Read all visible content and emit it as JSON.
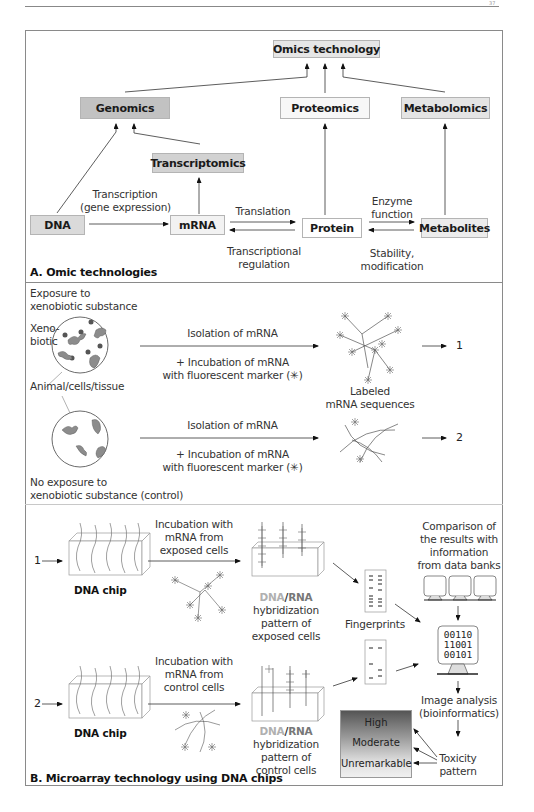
{
  "page": {
    "page_number": "37"
  },
  "panel_a": {
    "caption": "A. Omic technologies",
    "nodes": {
      "omics_technology": "Omics technology",
      "genomics": "Genomics",
      "proteomics": "Proteomics",
      "metabolomics": "Metabolomics",
      "transcriptomics": "Transcriptomics",
      "dna": "DNA",
      "mrna": "mRNA",
      "protein": "Protein",
      "metabolites": "Metabolites"
    },
    "edge_labels": {
      "transcription_1": "Transcription",
      "transcription_2": "(gene expression)",
      "translation": "Translation",
      "transcriptional_1": "Transcriptional",
      "transcriptional_2": "regulation",
      "enzyme_1": "Enzyme",
      "enzyme_2": "function",
      "stability_1": "Stability,",
      "stability_2": "modification"
    },
    "colors": {
      "omics_technology": "#e6e6e6",
      "genomics": "#c2c2c2",
      "proteomics": "#f7f7f7",
      "metabolomics": "#e4e4e4",
      "transcriptomics": "#d2d2d2",
      "dna": "#dadada",
      "mrna": "#f2f2f2",
      "protein": "#ffffff",
      "metabolites": "#ececec"
    }
  },
  "panel_exposure": {
    "exposure_1": "Exposure to",
    "exposure_2": "xenobiotic substance",
    "xenobiotic_1": "Xeno-",
    "xenobiotic_2": "biotic",
    "animal_label": "Animal/cells/tissue",
    "row1": {
      "top_label": "Isolation of mRNA",
      "bottom_1": "+ Incubation of mRNA",
      "bottom_2": "with fluorescent marker (✳)",
      "result_1": "Labeled",
      "result_2": "mRNA sequences",
      "output_number": "1"
    },
    "row2": {
      "top_label": "Isolation of mRNA",
      "bottom_1": "+ Incubation of mRNA",
      "bottom_2": "with fluorescent marker (✳)",
      "output_number": "2"
    },
    "control_1": "No exposure to",
    "control_2": "xenobiotic substance (control)"
  },
  "panel_b": {
    "caption": "B. Microarray technology using DNA chips",
    "row1": {
      "input_number": "1",
      "chip_label": "DNA chip",
      "incubation_1": "Incubation with",
      "incubation_2": "mRNA from",
      "incubation_3": "exposed cells",
      "hyb_dna": "DNA",
      "hyb_slash": "/",
      "hyb_rna": "RNA",
      "hyb_2": "hybridization",
      "hyb_3": "pattern of",
      "hyb_4": "exposed cells"
    },
    "row2": {
      "input_number": "2",
      "chip_label": "DNA chip",
      "incubation_1": "Incubation with",
      "incubation_2": "mRNA from",
      "incubation_3": "control cells",
      "hyb_dna": "DNA",
      "hyb_slash": "/",
      "hyb_rna": "RNA",
      "hyb_2": "hybridization",
      "hyb_3": "pattern of",
      "hyb_4": "control cells"
    },
    "fingerprints": "Fingerprints",
    "comparison_1": "Comparison of",
    "comparison_2": "the results with",
    "comparison_3": "information",
    "comparison_4": "from data banks",
    "binary_1": "00110",
    "binary_2": "11001",
    "binary_3": "00101",
    "image_analysis_1": "Image analysis",
    "image_analysis_2": "(bioinformatics)",
    "toxicity_1": "Toxicity",
    "toxicity_2": "pattern",
    "toxicity_levels": [
      "High",
      "Moderate",
      "Unremarkable"
    ]
  }
}
